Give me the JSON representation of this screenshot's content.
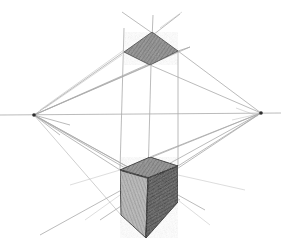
{
  "image": {
    "subject": "Two-point perspective pencil sketch of a cube viewed from above with its top face projected above the horizon",
    "width": 281,
    "height": 249,
    "colors": {
      "background": "#ffffff",
      "construction_line": "#9a9a9a",
      "graphite_dark": "#3a3a3a",
      "graphite_mid": "#6e6e6e",
      "graphite_light": "#a8a8a8"
    },
    "horizon_line": {
      "x1": 0,
      "y1": 115,
      "x2": 281,
      "y2": 113
    },
    "vanishing_points": {
      "left": {
        "x": 34,
        "y": 115
      },
      "right": {
        "x": 261,
        "y": 113
      }
    },
    "projected_top_face": {
      "left": [
        124,
        52
      ],
      "top": [
        152,
        32
      ],
      "right": [
        178,
        51
      ],
      "bottom": [
        150,
        65
      ]
    },
    "cube": {
      "top_left": [
        120,
        170
      ],
      "top_back": [
        150,
        157
      ],
      "top_right": [
        178,
        166
      ],
      "top_front": [
        148,
        178
      ],
      "bottom_left": [
        121,
        215
      ],
      "bottom_front": [
        146,
        238
      ],
      "bottom_right": [
        178,
        202
      ]
    }
  }
}
